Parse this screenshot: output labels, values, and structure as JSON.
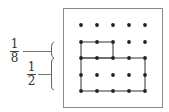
{
  "labels": {
    "upper": {
      "numerator": "1",
      "denominator": "8"
    },
    "lower": {
      "numerator": "1",
      "denominator": "2"
    }
  },
  "grid": {
    "rows": 5,
    "cols": 5,
    "x": [
      81,
      97,
      113,
      129,
      145
    ],
    "y": [
      25,
      42,
      58,
      75,
      91
    ]
  },
  "shapes": [
    {
      "name": "small-rectangle",
      "from": [
        0,
        1
      ],
      "to": [
        2,
        2
      ]
    },
    {
      "name": "large-rectangle",
      "from": [
        0,
        2
      ],
      "to": [
        4,
        4
      ]
    }
  ],
  "colors": {
    "line": "#555555",
    "dot": "#222222",
    "frame": "#888888"
  }
}
